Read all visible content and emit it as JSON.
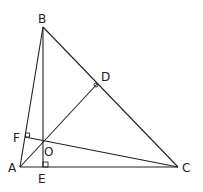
{
  "diagram": {
    "type": "geometry",
    "points": {
      "A": {
        "label": "A",
        "x": 20,
        "y": 167
      },
      "B": {
        "label": "B",
        "x": 43,
        "y": 27
      },
      "C": {
        "label": "C",
        "x": 178,
        "y": 167
      },
      "D": {
        "label": "D",
        "x": 98,
        "y": 83
      },
      "E": {
        "label": "E",
        "x": 43,
        "y": 167
      },
      "F": {
        "label": "F",
        "x": 25,
        "y": 137
      },
      "O": {
        "label": "O",
        "x": 43,
        "y": 142
      }
    },
    "segments": [
      [
        "A",
        "B"
      ],
      [
        "B",
        "C"
      ],
      [
        "A",
        "C"
      ],
      [
        "A",
        "D"
      ],
      [
        "B",
        "E"
      ],
      [
        "C",
        "F"
      ]
    ],
    "right_angles": [
      "D",
      "E",
      "F"
    ],
    "stroke_color": "#222222",
    "background": "#ffffff"
  }
}
